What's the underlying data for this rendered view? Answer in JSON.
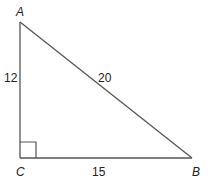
{
  "diagram": {
    "type": "right-triangle",
    "stroke_color": "#555555",
    "vertices": {
      "A": {
        "label": "A",
        "x": 20,
        "y": 22
      },
      "B": {
        "label": "B",
        "x": 192,
        "y": 158
      },
      "C": {
        "label": "C",
        "x": 20,
        "y": 158
      }
    },
    "sides": {
      "AC": {
        "label": "12"
      },
      "AB": {
        "label": "20"
      },
      "CB": {
        "label": "15"
      }
    },
    "right_angle_at": "C"
  }
}
